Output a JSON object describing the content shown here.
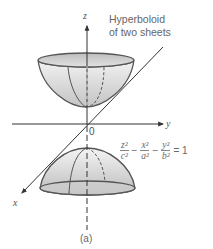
{
  "figure": {
    "title_lines": [
      "Hyperboloid",
      "of two sheets"
    ],
    "axes": {
      "x": "x",
      "y": "y",
      "z": "z"
    },
    "origin_label": "0",
    "caption": "(a)",
    "equation": {
      "terms": [
        {
          "num": "z²",
          "den": "c²"
        },
        {
          "num": "x²",
          "den": "a²"
        },
        {
          "num": "y²",
          "den": "b²"
        }
      ],
      "operators": [
        "−",
        "−"
      ],
      "rhs": "= 1"
    },
    "colors": {
      "line": "#444444",
      "surface_light": "#e6e6e6",
      "surface_dark": "#bdbdbd",
      "text": "#555555"
    }
  }
}
